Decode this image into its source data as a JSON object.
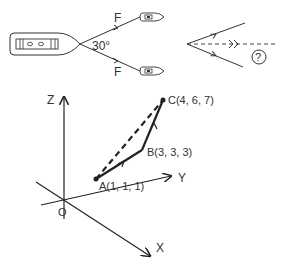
{
  "figure1": {
    "force_label_top": "F",
    "force_label_bottom": "F",
    "angle_label": "30°"
  },
  "figure2": {
    "unknown_label": "?"
  },
  "figure3": {
    "axis_z": "Z",
    "axis_y": "Y",
    "axis_x": "X",
    "origin": "O",
    "point_a": "A(1, 1, 1)",
    "point_b": "B(3, 3, 3)",
    "point_c": "C(4, 6, 7)"
  }
}
